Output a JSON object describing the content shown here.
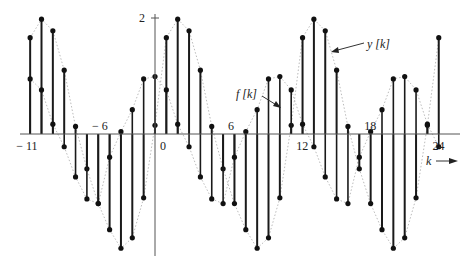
{
  "chart_data": {
    "type": "stem",
    "title": "",
    "xlabel": "k",
    "ylabel": "",
    "x": [
      -11,
      -10,
      -9,
      -8,
      -7,
      -6,
      -5,
      -4,
      -3,
      -2,
      -1,
      0,
      1,
      2,
      3,
      4,
      5,
      6,
      7,
      8,
      9,
      10,
      11,
      12,
      13,
      14,
      15,
      16,
      17,
      18,
      19,
      20,
      21,
      22,
      23,
      24,
      25
    ],
    "xlim": [
      -11,
      25
    ],
    "ylim": [
      -2,
      2
    ],
    "x_tick_labels": [
      "-11",
      "-6",
      "0",
      "6",
      "12",
      "18",
      "24"
    ],
    "x_tick_values": [
      -11,
      -6,
      0,
      6,
      12,
      18,
      24
    ],
    "y_tick_labels": [
      "2"
    ],
    "y_tick_values": [
      2
    ],
    "series": [
      {
        "name": "y[k]",
        "description": "larger-amplitude sampled sinusoid, period 12",
        "values": [
          1.66,
          1.98,
          1.78,
          1.1,
          0.13,
          -0.6,
          -1.2,
          -1.65,
          -1.97,
          -1.79,
          -1.1,
          0.15,
          1.66,
          1.98,
          1.78,
          1.1,
          0.13,
          -0.6,
          -1.2,
          -1.65,
          -1.97,
          -1.79,
          -1.1,
          0.15,
          1.66,
          1.98,
          1.78,
          1.1,
          0.13,
          -0.6,
          -1.2,
          -1.65,
          -1.97,
          -1.79,
          -1.1,
          0.15,
          1.66
        ]
      },
      {
        "name": "f[k]",
        "description": "smaller-amplitude sampled sinusoid, period 12",
        "values": [
          0.95,
          0.76,
          0.17,
          -0.22,
          -0.74,
          -1.12,
          -1.2,
          -0.4,
          0.04,
          0.42,
          0.95,
          0.99,
          0.76,
          0.17,
          -0.22,
          -0.74,
          -1.12,
          -1.2,
          -0.4,
          0.04,
          0.42,
          0.95,
          0.99,
          0.76,
          0.17,
          -0.22,
          -0.74,
          -1.12,
          -1.2,
          -0.4,
          0.04,
          0.42,
          0.95,
          0.99,
          0.76,
          0.17,
          -0.22
        ]
      }
    ],
    "annotations": [
      {
        "text": "f [k]",
        "points_to_k": 11
      },
      {
        "text": "y [k]",
        "points_to_k": 16
      },
      {
        "text": "k →",
        "position": "lower-right, x-axis direction"
      }
    ],
    "grid": false,
    "legend": "none (inline arrow annotations)",
    "curve_style": "dotted envelope through samples"
  },
  "axis": {
    "x_label": "k",
    "y_top_label": "2"
  },
  "labels": {
    "f": "f [k]",
    "y": "y [k]"
  }
}
